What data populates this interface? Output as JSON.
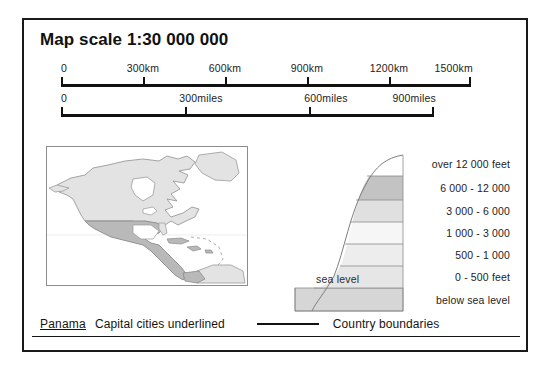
{
  "title": "Map scale 1:30 000 000",
  "scales": [
    {
      "name": "kilometres-scale",
      "unit": "km",
      "bar_left_px": 22,
      "bar_width_px": 410,
      "ticks": [
        {
          "label": "0",
          "value": 0,
          "pos_pct": 0
        },
        {
          "label": "300km",
          "value": 300,
          "pos_pct": 20
        },
        {
          "label": "600km",
          "value": 600,
          "pos_pct": 40
        },
        {
          "label": "900km",
          "value": 900,
          "pos_pct": 60
        },
        {
          "label": "1200km",
          "value": 1200,
          "pos_pct": 80
        },
        {
          "label": "1500km",
          "value": 1500,
          "pos_pct": 100
        }
      ]
    },
    {
      "name": "miles-scale",
      "unit": "miles",
      "bar_left_px": 22,
      "bar_width_px": 373,
      "ticks": [
        {
          "label": "0",
          "value": 0,
          "pos_pct": 0
        },
        {
          "label": "300miles",
          "value": 300,
          "pos_pct": 33.3
        },
        {
          "label": "600miles",
          "value": 600,
          "pos_pct": 66.6
        },
        {
          "label": "900miles",
          "value": 900,
          "pos_pct": 100
        }
      ]
    }
  ],
  "inset_map": {
    "name": "north-america-locator-map",
    "land_fill": "#e3e3e3",
    "highlight_fill": "#b9b9b9",
    "outline": "#8d8d8d",
    "frame": "#8d8d8d"
  },
  "elevation_key": {
    "sea_level_label": "sea  level",
    "bands": [
      {
        "label": "over 12 000 feet",
        "color": "#ffffff"
      },
      {
        "label": "6 000 - 12 000",
        "color": "#c3c3c3"
      },
      {
        "label": "3 000 - 6 000",
        "color": "#e0e0e0"
      },
      {
        "label": "1 000 - 3 000",
        "color": "#f6f6f6"
      },
      {
        "label": "500 - 1 000",
        "color": "#ededed"
      },
      {
        "label": "0 - 500 feet",
        "color": "#e6e6e6"
      },
      {
        "label": "below sea level",
        "color": "#d6d6d6"
      }
    ]
  },
  "bottom_legend": {
    "capital_sample": "Panama",
    "capital_caption": "Capital cities underlined",
    "boundary_caption": "Country boundaries"
  }
}
